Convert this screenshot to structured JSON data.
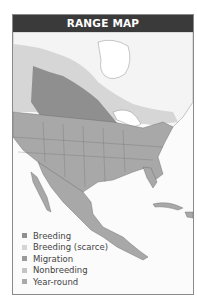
{
  "header": {
    "title": "RANGE MAP"
  },
  "legend": {
    "items": [
      {
        "label": "Breeding",
        "color": "#8f8f8f"
      },
      {
        "label": "Breeding (scarce)",
        "color": "#d4d4d4"
      },
      {
        "label": "Migration",
        "color": "#9a9a9a"
      },
      {
        "label": "Nonbreeding",
        "color": "#c4c4c4"
      },
      {
        "label": "Year-round",
        "color": "#aaaaaa"
      }
    ]
  },
  "colors": {
    "header_bg": "#3a3a3a",
    "breeding": "#8f8f8f",
    "breeding_scarce": "#d4d4d4",
    "year_round": "#a8a8a8",
    "land": "#f7f7f7",
    "border": "#555555"
  }
}
